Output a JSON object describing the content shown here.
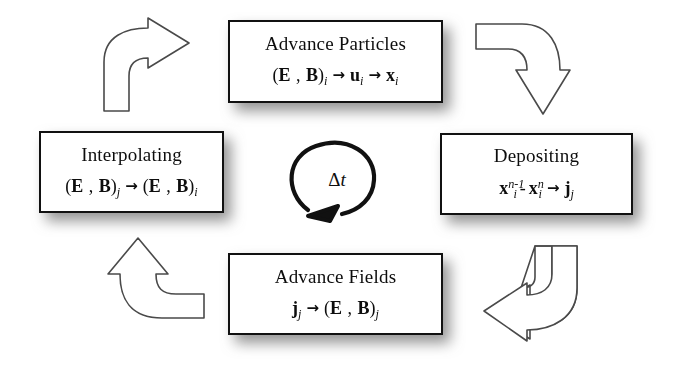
{
  "diagram": {
    "type": "cycle-flow-diagram",
    "title_visible": false,
    "background_color": "#ffffff",
    "box_border_color": "#111111",
    "text_color": "#0d0d0d",
    "shadow_color": "#8a8a8a",
    "center": {
      "label": "Δt",
      "delta": "Δ",
      "t": "t",
      "arrow_direction": "counterclockwise",
      "name": "timestep-cycle-arrow"
    },
    "nodes": [
      {
        "id": "advance-particles",
        "title": "Advance Particles",
        "formula_plain": "(E , B)i → ui → xi",
        "formula_parts": {
          "open": "(",
          "E": "E",
          "comma": " , ",
          "B": "B",
          "close": ")",
          "sub1": "i",
          "arrow1": "→",
          "u": "u",
          "sub2": "i",
          "arrow2": "→",
          "x": "x",
          "sub3": "i"
        },
        "position": "top"
      },
      {
        "id": "depositing",
        "title": "Depositing",
        "formula_plain": "xi^(n-1) - xi^n → jj",
        "formula_parts": {
          "x1": "x",
          "sub1": "i",
          "sup1": "n-1",
          "minus": "-",
          "x2": "x",
          "sub2": "i",
          "sup2": "n",
          "arrow": "→",
          "j": "j",
          "sub3": "j"
        },
        "position": "right"
      },
      {
        "id": "advance-fields",
        "title": "Advance Fields",
        "formula_plain": "jj → (E , B)j",
        "formula_parts": {
          "j": "j",
          "sub1": "j",
          "arrow": "→",
          "open": "(",
          "E": "E",
          "comma": " , ",
          "B": "B",
          "close": ")",
          "sub2": "j"
        },
        "position": "bottom"
      },
      {
        "id": "interpolating",
        "title": "Interpolating",
        "formula_plain": "(E , B)j → (E , B)i",
        "formula_parts": {
          "open1": "(",
          "E1": "E",
          "comma1": " , ",
          "B1": "B",
          "close1": ")",
          "sub1": "j",
          "arrow": "→",
          "open2": "(",
          "E2": "E",
          "comma2": " , ",
          "B2": "B",
          "close2": ")",
          "sub2": "i"
        },
        "position": "left"
      }
    ],
    "connectors": [
      {
        "id": "arrow-top-left",
        "from": "interpolating",
        "to": "advance-particles",
        "shape": "curved-block-arrow",
        "points": "up-right"
      },
      {
        "id": "arrow-top-right",
        "from": "advance-particles",
        "to": "depositing",
        "shape": "curved-block-arrow",
        "points": "down"
      },
      {
        "id": "arrow-bottom-right",
        "from": "depositing",
        "to": "advance-fields",
        "shape": "curved-block-arrow",
        "points": "left"
      },
      {
        "id": "arrow-bottom-left",
        "from": "advance-fields",
        "to": "interpolating",
        "shape": "curved-block-arrow",
        "points": "up"
      }
    ]
  }
}
